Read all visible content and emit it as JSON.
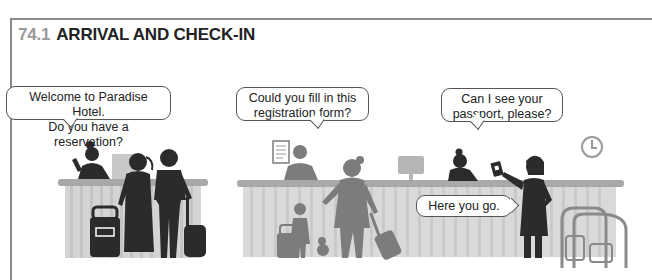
{
  "section": {
    "number": "74.1",
    "title": "ARRIVAL AND CHECK-IN"
  },
  "bubbles": [
    {
      "id": "welcome",
      "lines": [
        "Welcome to Paradise Hotel.",
        "Do you have a reservation?"
      ]
    },
    {
      "id": "registration",
      "lines": [
        "Could you fill in this",
        "registration form?"
      ]
    },
    {
      "id": "passport",
      "lines": [
        "Can I see your",
        "passport, please?"
      ]
    },
    {
      "id": "here",
      "lines": [
        "Here you go."
      ]
    }
  ],
  "illustration": {
    "scenes": [
      "couple-checking-in",
      "mother-and-child-registration",
      "guest-showing-passport"
    ],
    "icons": [
      "receptionist-icon",
      "suitcase-icon",
      "clock-icon",
      "monitor-icon",
      "registration-form-icon",
      "passport-icon",
      "luggage-cart-icon",
      "teddy-bear-icon"
    ]
  },
  "colors": {
    "dark_figure": "#2b2b2b",
    "grey_figure": "#7c7c7c",
    "desk": "#cfcfcf",
    "desk_top": "#a8a8a8",
    "title_number": "#9a9a9a"
  }
}
